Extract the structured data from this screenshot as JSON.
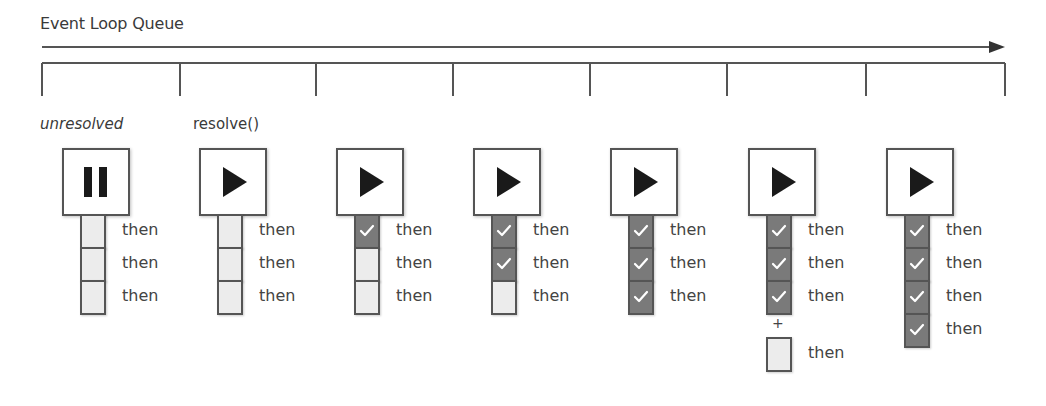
{
  "diagram": {
    "title": "Event Loop Queue",
    "timeline": {
      "arrow_y": 47,
      "arrow_x_start": 42,
      "arrow_x_end": 1005,
      "bracket_y": 63,
      "tick_bottom_y": 96,
      "tick_x": [
        42,
        180,
        316,
        453,
        590,
        727,
        866,
        1005
      ]
    },
    "state_labels": [
      {
        "text": "unresolved",
        "italic": true,
        "x": 40
      },
      {
        "text": "resolve()",
        "italic": false,
        "x": 193
      }
    ],
    "colors": {
      "line": "#555555",
      "cell_pending": "#ececec",
      "cell_done": "#7a7a7a",
      "check": "#ffffff",
      "icon": "#1a1a1a"
    },
    "steps": [
      {
        "x": 62,
        "icon": "pause",
        "cells": [
          "pending",
          "pending",
          "pending"
        ],
        "labels": [
          "then",
          "then",
          "then"
        ],
        "extra": null
      },
      {
        "x": 199,
        "icon": "play",
        "cells": [
          "pending",
          "pending",
          "pending"
        ],
        "labels": [
          "then",
          "then",
          "then"
        ],
        "extra": null
      },
      {
        "x": 336,
        "icon": "play",
        "cells": [
          "done",
          "pending",
          "pending"
        ],
        "labels": [
          "then",
          "then",
          "then"
        ],
        "extra": null
      },
      {
        "x": 473,
        "icon": "play",
        "cells": [
          "done",
          "done",
          "pending"
        ],
        "labels": [
          "then",
          "then",
          "then"
        ],
        "extra": null
      },
      {
        "x": 610,
        "icon": "play",
        "cells": [
          "done",
          "done",
          "done"
        ],
        "labels": [
          "then",
          "then",
          "then"
        ],
        "extra": null
      },
      {
        "x": 748,
        "icon": "play",
        "cells": [
          "done",
          "done",
          "done"
        ],
        "labels": [
          "then",
          "then",
          "then"
        ],
        "extra": {
          "plus": "+",
          "cell": "pending",
          "label": "then"
        }
      },
      {
        "x": 886,
        "icon": "play",
        "cells": [
          "done",
          "done",
          "done",
          "done"
        ],
        "labels": [
          "then",
          "then",
          "then",
          "then"
        ],
        "extra": null
      }
    ]
  }
}
